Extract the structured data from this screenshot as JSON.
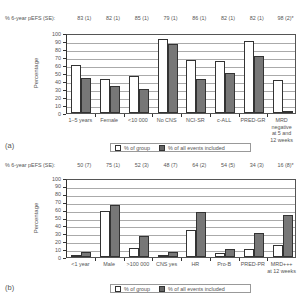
{
  "chart_data": [
    {
      "panel": "(a)",
      "type": "bar",
      "title": "",
      "pefs_label": "% 6-year pEFS (SE):",
      "pefs": [
        "83 (1)",
        "82 (1)",
        "85 (1)",
        "79 (1)",
        "86 (1)",
        "82 (1)",
        "82 (1)",
        "98 (2)*"
      ],
      "categories": [
        "1–5 years",
        "Female",
        "<10 000",
        "No CNS",
        "NCI-SR",
        "c-ALL",
        "PRED-GR",
        "MRD negative at 5 and 12 weeks"
      ],
      "category_lines": [
        [
          "1–5 years"
        ],
        [
          "Female"
        ],
        [
          "<10 000"
        ],
        [
          "No CNS"
        ],
        [
          "NCI-SR"
        ],
        [
          "c-ALL"
        ],
        [
          "PRED-GR"
        ],
        [
          "MRD",
          "negative",
          "at 5 and",
          "12 weeks"
        ]
      ],
      "series": [
        {
          "name": "% of group",
          "color": "#ffffff",
          "values": [
            60,
            42,
            46,
            92,
            66,
            65,
            90,
            41
          ]
        },
        {
          "name": "% of all events included",
          "color": "#777777",
          "values": [
            44,
            34,
            30,
            86,
            42,
            50,
            71,
            3
          ]
        }
      ],
      "xlabel": "",
      "ylabel": "Percentage",
      "ylim": [
        0,
        100
      ],
      "yticks": [
        0,
        10,
        20,
        30,
        40,
        50,
        60,
        70,
        80,
        90,
        100
      ],
      "grid": true,
      "legend_position": "bottom-center"
    },
    {
      "panel": "(b)",
      "type": "bar",
      "title": "",
      "pefs_label": "% 6-year pEFS (SE):",
      "pefs": [
        "50 (7)",
        "75 (1)",
        "52 (3)",
        "48 (7)",
        "64 (2)",
        "54 (5)",
        "34 (3)",
        "16 (8)*"
      ],
      "categories": [
        "<1 year",
        "Male",
        ">100 000",
        "CNS yes",
        "HR",
        "Pro-B",
        "PRED-PR",
        "MRD+++ at 12 weeks"
      ],
      "category_lines": [
        [
          "<1 year"
        ],
        [
          "Male"
        ],
        [
          ">100 000"
        ],
        [
          "CNS yes"
        ],
        [
          "HR"
        ],
        [
          "Pro-B"
        ],
        [
          "PRED-PR"
        ],
        [
          "MRD+++",
          "at 12 weeks"
        ]
      ],
      "series": [
        {
          "name": "% of group",
          "color": "#ffffff",
          "values": [
            3,
            58,
            12,
            3,
            34,
            5,
            10,
            15
          ]
        },
        {
          "name": "% of all events included",
          "color": "#777777",
          "values": [
            6,
            66,
            27,
            6,
            57,
            10,
            30,
            53
          ]
        }
      ],
      "xlabel": "",
      "ylabel": "Percentage",
      "ylim": [
        0,
        100
      ],
      "yticks": [
        0,
        10,
        20,
        30,
        40,
        50,
        60,
        70,
        80,
        90,
        100
      ],
      "grid": true,
      "legend_position": "bottom-center"
    }
  ],
  "legend": {
    "group": "% of group",
    "events": "% of all events included"
  }
}
